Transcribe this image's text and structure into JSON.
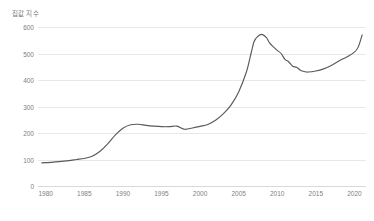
{
  "chart_data": {
    "type": "line",
    "title": "집값 지수",
    "xlabel": "",
    "ylabel": "",
    "xlim": [
      1979,
      2021.5
    ],
    "ylim": [
      0,
      600
    ],
    "grid": true,
    "legend": "none",
    "line_color": "#595959",
    "grid_color": "#e8e8e8",
    "tick_color": "#808080",
    "y_ticks": [
      0,
      100,
      200,
      300,
      400,
      500,
      600
    ],
    "y_tick_labels": [
      "0",
      "100",
      "200",
      "300",
      "400",
      "500",
      "600"
    ],
    "x_ticks": [
      1980,
      1985,
      1990,
      1995,
      2000,
      2005,
      2010,
      2015,
      2020
    ],
    "x_tick_labels": [
      "1980",
      "1985",
      "1990",
      "1995",
      "2000",
      "2005",
      "2010",
      "2015",
      "2020"
    ],
    "series": [
      {
        "name": "집값 지수",
        "x": [
          1979.5,
          1980,
          1981,
          1982,
          1983,
          1984,
          1985,
          1986,
          1987,
          1988,
          1989,
          1990,
          1991,
          1992,
          1993,
          1994,
          1995,
          1996,
          1997,
          1998,
          1999,
          2000,
          2001,
          2002,
          2003,
          2004,
          2005,
          2006,
          2006.6,
          2007,
          2007.5,
          2008,
          2008.6,
          2009,
          2009.5,
          2010,
          2010.5,
          2011,
          2011.5,
          2012,
          2012.5,
          2013,
          2013.5,
          2014,
          2015,
          2016,
          2017,
          2018,
          2019,
          2020,
          2020.5,
          2021
        ],
        "values": [
          87,
          88,
          90,
          93,
          96,
          100,
          104,
          112,
          130,
          158,
          192,
          218,
          231,
          233,
          229,
          226,
          224,
          224,
          226,
          214,
          219,
          225,
          232,
          248,
          272,
          305,
          355,
          430,
          500,
          545,
          565,
          572,
          560,
          540,
          525,
          512,
          500,
          478,
          468,
          452,
          448,
          437,
          432,
          430,
          434,
          442,
          455,
          472,
          487,
          505,
          525,
          570
        ]
      }
    ]
  }
}
